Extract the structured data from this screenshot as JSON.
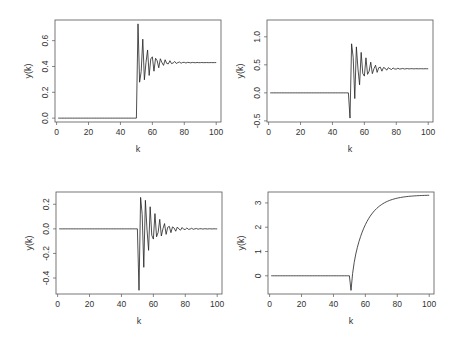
{
  "figure": {
    "background": "#ffffff",
    "line_color": "#222222",
    "frame_color": "#555555"
  },
  "chart_data": [
    {
      "type": "line",
      "panel": "top-left",
      "title": "",
      "xlabel": "k",
      "ylabel": "y(k)",
      "xlim": [
        -1,
        103
      ],
      "ylim": [
        -0.03,
        0.76
      ],
      "xticks": [
        0,
        20,
        40,
        60,
        80,
        100
      ],
      "yticks": [
        0.0,
        0.2,
        0.4,
        0.6
      ],
      "ytick_labels": [
        "0.0",
        "0.2",
        "0.4",
        "0.6"
      ],
      "grid": false,
      "model": {
        "kind": "damped-oscillation",
        "step_k": 51,
        "pre_value": 0.0,
        "final": 0.43,
        "amp": 0.3,
        "decay": 0.86,
        "omega": 2.2,
        "phase": 0
      },
      "key_points": [
        [
          0,
          0.0
        ],
        [
          50,
          0.0
        ],
        [
          51,
          0.73
        ],
        [
          52,
          0.22
        ],
        [
          54,
          0.66
        ],
        [
          56,
          0.25
        ],
        [
          60,
          0.31
        ],
        [
          70,
          0.39
        ],
        [
          80,
          0.42
        ],
        [
          100,
          0.43
        ]
      ]
    },
    {
      "type": "line",
      "panel": "top-right",
      "title": "",
      "xlabel": "k",
      "ylabel": "y(k)",
      "xlim": [
        -1,
        103
      ],
      "ylim": [
        -0.52,
        1.3
      ],
      "xticks": [
        0,
        20,
        40,
        60,
        80,
        100
      ],
      "yticks": [
        -0.5,
        0.0,
        0.5,
        1.0
      ],
      "ytick_labels": [
        "-0.5",
        "0.0",
        "0.5",
        "1.0"
      ],
      "grid": false,
      "model": {
        "kind": "damped-oscillation",
        "step_k": 51,
        "pre_value": 0.0,
        "final": 0.43,
        "amp": -0.88,
        "decay": 0.86,
        "omega": 2.2,
        "phase": 0
      },
      "key_points": [
        [
          0,
          0.0
        ],
        [
          50,
          0.0
        ],
        [
          51,
          -0.45
        ],
        [
          52,
          1.25
        ],
        [
          53,
          -0.35
        ],
        [
          55,
          1.0
        ],
        [
          57,
          0.9
        ],
        [
          60,
          0.15
        ],
        [
          70,
          0.35
        ],
        [
          80,
          0.42
        ],
        [
          100,
          0.43
        ]
      ]
    },
    {
      "type": "line",
      "panel": "bottom-left",
      "title": "",
      "xlabel": "k",
      "ylabel": "y(k)",
      "xlim": [
        -1,
        103
      ],
      "ylim": [
        -0.53,
        0.3
      ],
      "xticks": [
        0,
        20,
        40,
        60,
        80,
        100
      ],
      "yticks": [
        -0.4,
        -0.2,
        0.0,
        0.2
      ],
      "ytick_labels": [
        "-0.4",
        "-0.2",
        "0.0",
        "0.2"
      ],
      "grid": false,
      "model": {
        "kind": "damped-oscillation",
        "step_k": 51,
        "pre_value": 0.0,
        "final": 0.0,
        "amp": -0.5,
        "decay": 0.87,
        "omega": 2.2,
        "phase": 0
      },
      "key_points": [
        [
          0,
          0.0
        ],
        [
          50,
          0.0
        ],
        [
          51,
          -0.5
        ],
        [
          52,
          0.27
        ],
        [
          53,
          -0.35
        ],
        [
          55,
          0.28
        ],
        [
          60,
          -0.18
        ],
        [
          70,
          0.04
        ],
        [
          80,
          0.01
        ],
        [
          100,
          0.0
        ]
      ]
    },
    {
      "type": "line",
      "panel": "bottom-right",
      "title": "",
      "xlabel": "k",
      "ylabel": "y(k)",
      "xlim": [
        -1,
        103
      ],
      "ylim": [
        -0.75,
        3.45
      ],
      "xticks": [
        0,
        20,
        40,
        60,
        80,
        100
      ],
      "yticks": [
        0,
        1,
        2,
        3
      ],
      "ytick_labels": [
        "0",
        "1",
        "2",
        "3"
      ],
      "grid": false,
      "model": {
        "kind": "undershoot-rise",
        "step_k": 51,
        "pre_value": 0.0,
        "final": 3.33,
        "dip": -0.6,
        "tau": 9.0
      },
      "key_points": [
        [
          0,
          0.0
        ],
        [
          50,
          0.0
        ],
        [
          51,
          -0.6
        ],
        [
          55,
          0.9
        ],
        [
          60,
          2.0
        ],
        [
          70,
          2.8
        ],
        [
          80,
          3.15
        ],
        [
          90,
          3.27
        ],
        [
          100,
          3.33
        ]
      ]
    }
  ],
  "panels": [
    {
      "name": "top-left",
      "box": {
        "left": 55,
        "top": 20,
        "right": 221,
        "bottom": 122
      }
    },
    {
      "name": "top-right",
      "box": {
        "left": 267,
        "top": 20,
        "right": 433,
        "bottom": 122
      }
    },
    {
      "name": "bottom-left",
      "box": {
        "left": 56,
        "top": 192,
        "right": 222,
        "bottom": 294
      }
    },
    {
      "name": "bottom-right",
      "box": {
        "left": 268,
        "top": 192,
        "right": 434,
        "bottom": 294
      }
    }
  ]
}
